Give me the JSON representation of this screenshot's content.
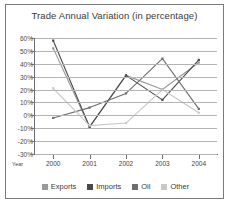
{
  "chart_data": {
    "type": "line",
    "title": "Trade Annual Variation (in percentage)",
    "xlabel": "Year",
    "ylabel": "",
    "categories": [
      "2000",
      "2001",
      "2002",
      "2003",
      "2004"
    ],
    "ytick_labels": [
      "60%",
      "50%",
      "40%",
      "30%",
      "20%",
      "10%",
      "0%",
      "-10%",
      "-20%",
      "-30%"
    ],
    "ytick_values": [
      60,
      50,
      40,
      30,
      20,
      10,
      0,
      -10,
      -20,
      -30
    ],
    "ylim": [
      -30,
      60
    ],
    "grid": true,
    "legend_position": "bottom",
    "series": [
      {
        "name": "Exports",
        "color": "#9a9a9a",
        "values": [
          52,
          -9,
          31,
          20,
          41
        ]
      },
      {
        "name": "Imports",
        "color": "#4a4a4a",
        "values": [
          58,
          -9,
          31,
          12,
          43
        ]
      },
      {
        "name": "Oil",
        "color": "#6e6e6e",
        "values": [
          -2,
          6,
          17,
          44,
          5
        ]
      },
      {
        "name": "Other",
        "color": "#c8c8c8",
        "values": [
          21,
          -8,
          -6,
          20,
          2
        ]
      }
    ]
  },
  "legend": {
    "items": [
      {
        "label": "Exports"
      },
      {
        "label": "Imports"
      },
      {
        "label": "Oil"
      },
      {
        "label": "Other"
      }
    ]
  }
}
